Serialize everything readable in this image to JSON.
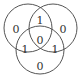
{
  "diagram": {
    "type": "venn-3",
    "circles": [
      {
        "id": "A",
        "cx": 28,
        "cy": 28,
        "r": 24
      },
      {
        "id": "B",
        "cx": 53,
        "cy": 28,
        "r": 24
      },
      {
        "id": "C",
        "cx": 40,
        "cy": 50,
        "r": 24
      }
    ],
    "regions": {
      "a_only": {
        "label": "0",
        "x": 16,
        "y": 29
      },
      "ab": {
        "label": "1",
        "x": 40,
        "y": 20
      },
      "b_only": {
        "label": "0",
        "x": 63,
        "y": 29
      },
      "abc": {
        "label": "0",
        "x": 40,
        "y": 40
      },
      "ac": {
        "label": "1",
        "x": 25,
        "y": 49
      },
      "bc": {
        "label": "1",
        "x": 55,
        "y": 49
      },
      "c_only": {
        "label": "0",
        "x": 40,
        "y": 66
      }
    },
    "stroke_color": "#555555",
    "text_color": "#333333"
  }
}
